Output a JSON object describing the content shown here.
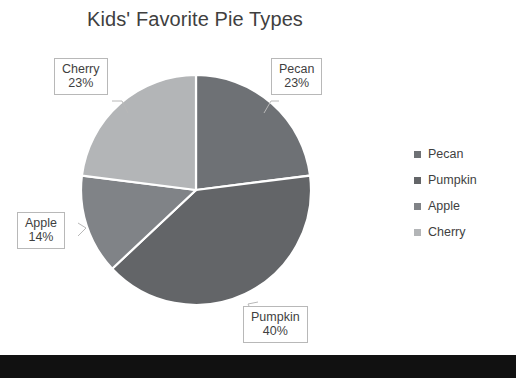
{
  "chart_data": {
    "type": "pie",
    "title": "Kids' Favorite Pie Types",
    "xlabel": "",
    "ylabel": "",
    "legend_position": "right",
    "grid": false,
    "start_angle_deg": 0,
    "direction": "clockwise",
    "categories": [
      "Pecan",
      "Pumpkin",
      "Apple",
      "Cherry"
    ],
    "values": [
      23,
      40,
      14,
      23
    ],
    "value_unit": "%",
    "slice_colors": [
      "#6e7175",
      "#636568",
      "#808387",
      "#b3b5b7"
    ],
    "slice_border_color": "#ffffff",
    "slices": [
      {
        "label": "Pecan",
        "value": 23,
        "display": "23%",
        "color": "#6e7175"
      },
      {
        "label": "Pumpkin",
        "value": 40,
        "display": "40%",
        "color": "#636568"
      },
      {
        "label": "Apple",
        "value": 14,
        "display": "14%",
        "color": "#808387"
      },
      {
        "label": "Cherry",
        "value": 23,
        "display": "23%",
        "color": "#b3b5b7"
      }
    ]
  },
  "title": {
    "text": "Kids' Favorite Pie Types"
  },
  "callouts": {
    "cherry": {
      "name": "Cherry",
      "value": "23%"
    },
    "pecan": {
      "name": "Pecan",
      "value": "23%"
    },
    "apple": {
      "name": "Apple",
      "value": "14%"
    },
    "pumpkin": {
      "name": "Pumpkin",
      "value": "40%"
    }
  },
  "legend": {
    "items": [
      {
        "label": "Pecan",
        "color": "#6e7175"
      },
      {
        "label": "Pumpkin",
        "color": "#636568"
      },
      {
        "label": "Apple",
        "color": "#808387"
      },
      {
        "label": "Cherry",
        "color": "#b3b5b7"
      }
    ]
  },
  "colors": {
    "background": "#ffffff",
    "text": "#3f3f3f",
    "callout_border": "#b8b8b8",
    "bottom_bar": "#111111"
  }
}
